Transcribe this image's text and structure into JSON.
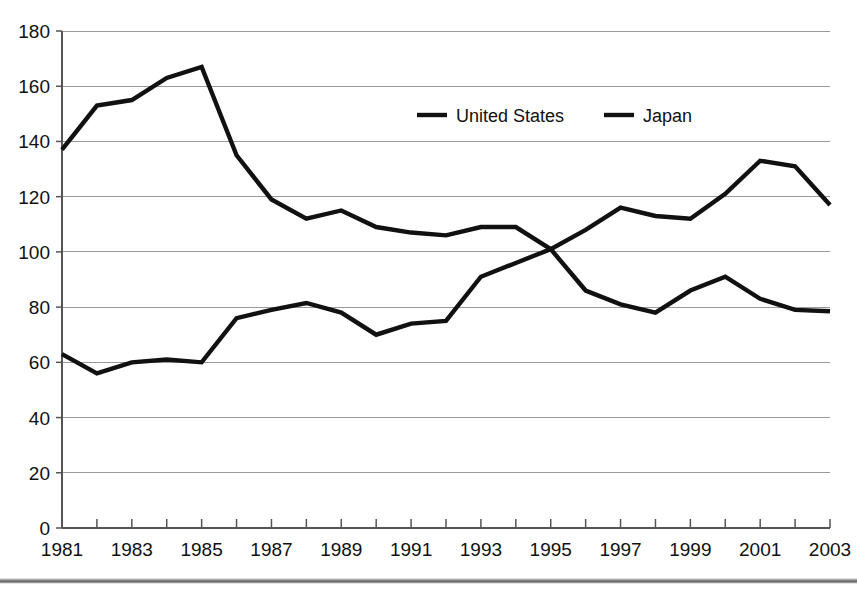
{
  "chart_data": {
    "type": "line",
    "title": "",
    "subtitle": "",
    "xlabel": "",
    "ylabel": "",
    "x": [
      1981,
      1982,
      1983,
      1984,
      1985,
      1986,
      1987,
      1988,
      1989,
      1990,
      1991,
      1992,
      1993,
      1994,
      1995,
      1996,
      1997,
      1998,
      1999,
      2000,
      2001,
      2002,
      2003
    ],
    "xlim": [
      1981,
      2003
    ],
    "ylim": [
      0,
      180
    ],
    "ytick_labels": [
      "0",
      "20",
      "40",
      "60",
      "80",
      "100",
      "120",
      "140",
      "160",
      "180"
    ],
    "yticks": [
      0,
      20,
      40,
      60,
      80,
      100,
      120,
      140,
      160,
      180
    ],
    "xtick_labels": [
      "1981",
      "1983",
      "1985",
      "1987",
      "1989",
      "1991",
      "1993",
      "1995",
      "1997",
      "1999",
      "2001",
      "2003"
    ],
    "xticks": [
      1981,
      1983,
      1985,
      1987,
      1989,
      1991,
      1993,
      1995,
      1997,
      1999,
      2001,
      2003
    ],
    "grid": "horizontal",
    "legend_position": "top-center",
    "series": [
      {
        "name": "United States",
        "color": "#111111",
        "values": [
          137,
          153,
          155,
          163,
          167,
          135,
          119,
          112,
          115,
          109,
          107,
          106,
          109,
          109,
          101,
          108,
          116,
          113,
          112,
          121,
          133,
          131,
          117
        ]
      },
      {
        "name": "Japan",
        "color": "#111111",
        "values": [
          63,
          56,
          60,
          61,
          60,
          76,
          79,
          81.5,
          78,
          70,
          74,
          75,
          91,
          96,
          101,
          86,
          81,
          78,
          86,
          91,
          83,
          79,
          78.5
        ]
      }
    ]
  },
  "legend": {
    "entries": [
      {
        "label": "United States"
      },
      {
        "label": "Japan"
      }
    ]
  }
}
